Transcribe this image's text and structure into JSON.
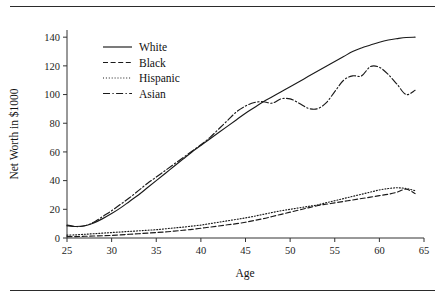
{
  "page": {
    "partial_header_text": "",
    "background_color": "#ffffff",
    "ink_color": "#1a1a1a"
  },
  "rules": {
    "top": "",
    "bottom": ""
  },
  "axes": {
    "x_title": "Age",
    "y_title": "Net Worth in $1000",
    "x_ticks": [
      "25",
      "30",
      "35",
      "40",
      "45",
      "50",
      "55",
      "60",
      "65"
    ],
    "y_ticks": [
      "0",
      "20",
      "40",
      "60",
      "80",
      "100",
      "120",
      "140"
    ]
  },
  "legend": {
    "items": [
      {
        "label": "White",
        "dash": "solid"
      },
      {
        "label": "Black",
        "dash": "dashed"
      },
      {
        "label": "Hispanic",
        "dash": "dotted"
      },
      {
        "label": "Asian",
        "dash": "dashdot"
      }
    ]
  },
  "chart_data": {
    "type": "line",
    "title": "",
    "xlabel": "Age",
    "ylabel": "Net Worth in $1000",
    "xlim": [
      25,
      65
    ],
    "ylim": [
      0,
      145
    ],
    "xticks": [
      25,
      30,
      35,
      40,
      45,
      50,
      55,
      60,
      65
    ],
    "yticks": [
      0,
      20,
      40,
      60,
      80,
      100,
      120,
      140
    ],
    "grid": false,
    "legend_position": "upper-left-inside",
    "x": [
      25,
      26,
      27,
      28,
      29,
      30,
      31,
      32,
      33,
      34,
      35,
      36,
      37,
      38,
      39,
      40,
      41,
      42,
      43,
      44,
      45,
      46,
      47,
      48,
      49,
      50,
      51,
      52,
      53,
      54,
      55,
      56,
      57,
      58,
      59,
      60,
      61,
      62,
      63,
      64
    ],
    "series": [
      {
        "name": "White",
        "dash": "solid",
        "values": [
          8.5,
          8.0,
          8.5,
          10.5,
          13.5,
          17.0,
          21.0,
          25.5,
          30.0,
          35.0,
          40.0,
          45.0,
          50.0,
          55.0,
          60.0,
          64.5,
          69.0,
          73.5,
          78.0,
          82.5,
          87.0,
          91.0,
          95.0,
          98.5,
          102.0,
          105.5,
          109.0,
          112.5,
          116.0,
          119.5,
          123.0,
          126.5,
          130.0,
          132.5,
          134.5,
          136.5,
          138.0,
          139.0,
          139.8,
          140.0
        ]
      },
      {
        "name": "Black",
        "dash": "dashed",
        "values": [
          1.0,
          1.0,
          1.2,
          1.4,
          1.6,
          1.8,
          2.2,
          2.6,
          3.0,
          3.4,
          3.8,
          4.2,
          4.8,
          5.4,
          6.0,
          6.8,
          7.6,
          8.4,
          9.2,
          10.0,
          11.0,
          12.2,
          13.5,
          15.0,
          16.5,
          18.0,
          19.5,
          21.0,
          22.5,
          23.5,
          24.5,
          25.5,
          26.5,
          27.5,
          28.5,
          29.5,
          30.5,
          32.0,
          34.0,
          31.0
        ]
      },
      {
        "name": "Hispanic",
        "dash": "dotted",
        "values": [
          2.0,
          2.2,
          2.6,
          3.0,
          3.4,
          3.8,
          4.2,
          4.6,
          5.0,
          5.4,
          5.8,
          6.4,
          7.0,
          7.6,
          8.3,
          9.0,
          10.0,
          11.0,
          12.0,
          13.0,
          14.0,
          15.2,
          16.5,
          17.8,
          19.0,
          20.0,
          21.0,
          22.0,
          23.0,
          24.5,
          26.0,
          27.5,
          29.0,
          30.5,
          32.0,
          33.5,
          34.5,
          35.0,
          34.5,
          33.0
        ]
      },
      {
        "name": "Asian",
        "dash": "dashdot",
        "values": [
          9.0,
          8.0,
          8.5,
          11.0,
          15.0,
          19.0,
          23.5,
          28.0,
          33.0,
          38.0,
          42.5,
          47.0,
          51.5,
          56.0,
          60.5,
          65.0,
          70.0,
          76.0,
          82.0,
          88.0,
          92.0,
          94.5,
          95.0,
          94.0,
          97.0,
          97.0,
          94.0,
          90.5,
          90.0,
          94.0,
          102.0,
          110.0,
          113.0,
          113.0,
          119.5,
          119.0,
          114.0,
          107.0,
          100.0,
          103.0
        ]
      }
    ]
  }
}
